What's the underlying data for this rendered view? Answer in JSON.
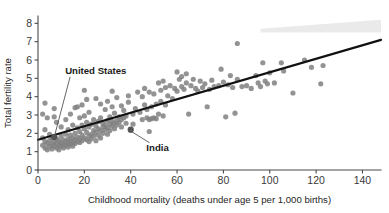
{
  "chart_data": {
    "type": "scatter",
    "title": "",
    "xlabel": "Childhood mortality (deaths under age 5 per 1,000 births)",
    "ylabel": "Total fertility rate",
    "xlim": [
      0,
      148
    ],
    "ylim": [
      0,
      8.4
    ],
    "xticks": [
      0,
      20,
      40,
      60,
      80,
      100,
      120,
      140
    ],
    "yticks": [
      0,
      1,
      2,
      3,
      4,
      5,
      6,
      7,
      8
    ],
    "xtick_labels": [
      "0",
      "20",
      "40",
      "60",
      "80",
      "100",
      "120",
      "140"
    ],
    "ytick_labels": [
      "0",
      "1",
      "2",
      "3",
      "4",
      "5",
      "6",
      "7",
      "8"
    ],
    "grid": false,
    "legend": null,
    "marker_color": "#808080",
    "trendline_color": "#111111",
    "trendline": {
      "x": [
        0,
        148
      ],
      "y": [
        1.65,
        7.1
      ],
      "slope": 0.0368,
      "intercept": 1.65
    },
    "confidence_band": {
      "visible": true,
      "color": "#d9d9d9",
      "x": [
        96,
        148
      ],
      "y_upper": [
        7.7,
        8.2
      ],
      "y_lower": [
        7.5,
        7.5
      ]
    },
    "annotations": [
      {
        "label": "United States",
        "point_x": 7,
        "point_y": 1.8,
        "label_x": 13,
        "label_y": 5.25,
        "highlight": true
      },
      {
        "label": "India",
        "point_x": 40,
        "point_y": 2.2,
        "label_x": 49,
        "label_y": 1.05,
        "highlight": true
      }
    ],
    "points": [
      [
        2,
        3.05
      ],
      [
        3,
        3.65
      ],
      [
        4,
        2.85
      ],
      [
        3,
        2.2
      ],
      [
        2,
        1.75
      ],
      [
        3,
        1.55
      ],
      [
        2,
        1.35
      ],
      [
        3,
        1.2
      ],
      [
        4,
        1.45
      ],
      [
        4,
        1.1
      ],
      [
        5,
        1.3
      ],
      [
        5,
        1.6
      ],
      [
        5,
        1.95
      ],
      [
        6,
        1.4
      ],
      [
        6,
        1.15
      ],
      [
        6,
        1.75
      ],
      [
        7,
        1.55
      ],
      [
        7,
        1.3
      ],
      [
        7,
        2.9
      ],
      [
        7,
        3.35
      ],
      [
        8,
        1.45
      ],
      [
        8,
        1.2
      ],
      [
        8,
        1.7
      ],
      [
        8,
        2.6
      ],
      [
        9,
        1.35
      ],
      [
        9,
        1.6
      ],
      [
        9,
        1.1
      ],
      [
        10,
        1.5
      ],
      [
        10,
        1.3
      ],
      [
        10,
        1.85
      ],
      [
        10,
        2.35
      ],
      [
        11,
        1.4
      ],
      [
        11,
        1.65
      ],
      [
        11,
        1.2
      ],
      [
        12,
        1.55
      ],
      [
        12,
        1.35
      ],
      [
        12,
        1.95
      ],
      [
        12,
        2.75
      ],
      [
        13,
        1.45
      ],
      [
        13,
        1.7
      ],
      [
        13,
        1.25
      ],
      [
        13,
        2.2
      ],
      [
        14,
        1.6
      ],
      [
        14,
        1.4
      ],
      [
        14,
        1.9
      ],
      [
        14,
        3.05
      ],
      [
        15,
        1.5
      ],
      [
        15,
        1.75
      ],
      [
        15,
        1.3
      ],
      [
        15,
        2.45
      ],
      [
        16,
        1.65
      ],
      [
        16,
        1.45
      ],
      [
        16,
        2.0
      ],
      [
        16,
        3.4
      ],
      [
        17,
        1.55
      ],
      [
        17,
        1.8
      ],
      [
        17,
        2.3
      ],
      [
        17,
        3.45
      ],
      [
        18,
        1.7
      ],
      [
        18,
        1.5
      ],
      [
        18,
        2.1
      ],
      [
        18,
        2.85
      ],
      [
        19,
        1.6
      ],
      [
        19,
        1.9
      ],
      [
        19,
        2.45
      ],
      [
        19,
        3.55
      ],
      [
        20,
        1.75
      ],
      [
        20,
        2.25
      ],
      [
        20,
        2.95
      ],
      [
        20,
        4.35
      ],
      [
        21,
        1.65
      ],
      [
        21,
        2.05
      ],
      [
        21,
        2.6
      ],
      [
        21,
        3.85
      ],
      [
        22,
        1.85
      ],
      [
        22,
        2.35
      ],
      [
        22,
        1.55
      ],
      [
        22,
        3.15
      ],
      [
        23,
        1.95
      ],
      [
        23,
        2.5
      ],
      [
        23,
        1.7
      ],
      [
        24,
        2.15
      ],
      [
        24,
        2.75
      ],
      [
        24,
        1.85
      ],
      [
        25,
        2.05
      ],
      [
        25,
        2.4
      ],
      [
        25,
        1.6
      ],
      [
        25,
        3.9
      ],
      [
        26,
        2.25
      ],
      [
        26,
        2.65
      ],
      [
        26,
        1.9
      ],
      [
        27,
        2.15
      ],
      [
        27,
        2.85
      ],
      [
        27,
        1.75
      ],
      [
        27,
        3.6
      ],
      [
        28,
        2.35
      ],
      [
        28,
        2.55
      ],
      [
        28,
        2.0
      ],
      [
        29,
        2.45
      ],
      [
        29,
        2.2
      ],
      [
        29,
        3.3
      ],
      [
        30,
        2.3
      ],
      [
        30,
        2.7
      ],
      [
        30,
        1.95
      ],
      [
        30,
        3.75
      ],
      [
        31,
        2.5
      ],
      [
        31,
        2.9
      ],
      [
        31,
        2.15
      ],
      [
        32,
        2.4
      ],
      [
        32,
        2.65
      ],
      [
        32,
        3.45
      ],
      [
        32,
        4.3
      ],
      [
        33,
        2.55
      ],
      [
        33,
        2.25
      ],
      [
        33,
        3.1
      ],
      [
        34,
        2.7
      ],
      [
        34,
        2.45
      ],
      [
        34,
        3.95
      ],
      [
        35,
        2.6
      ],
      [
        35,
        2.9
      ],
      [
        36,
        2.75
      ],
      [
        36,
        3.5
      ],
      [
        36,
        2.35
      ],
      [
        37,
        2.85
      ],
      [
        37,
        3.25
      ],
      [
        38,
        2.95
      ],
      [
        38,
        2.55
      ],
      [
        39,
        4.05
      ],
      [
        39,
        3.7
      ],
      [
        40,
        2.2
      ],
      [
        41,
        3.05
      ],
      [
        41,
        2.5
      ],
      [
        42,
        3.35
      ],
      [
        43,
        4.25
      ],
      [
        44,
        3.15
      ],
      [
        45,
        2.75
      ],
      [
        45,
        4.0
      ],
      [
        46,
        3.55
      ],
      [
        46,
        4.45
      ],
      [
        47,
        2.85
      ],
      [
        47,
        3.3
      ],
      [
        48,
        2.75
      ],
      [
        48,
        4.25
      ],
      [
        48,
        2.1
      ],
      [
        49,
        2.8
      ],
      [
        49,
        3.45
      ],
      [
        50,
        2.85
      ],
      [
        50,
        4.15
      ],
      [
        51,
        3.6
      ],
      [
        51,
        2.8
      ],
      [
        52,
        3.05
      ],
      [
        52,
        4.75
      ],
      [
        53,
        3.75
      ],
      [
        53,
        4.35
      ],
      [
        54,
        2.95
      ],
      [
        54,
        4.85
      ],
      [
        55,
        3.55
      ],
      [
        55,
        4.5
      ],
      [
        56,
        4.05
      ],
      [
        57,
        4.6
      ],
      [
        58,
        3.9
      ],
      [
        59,
        4.45
      ],
      [
        60,
        5.35
      ],
      [
        60,
        4.3
      ],
      [
        61,
        4.95
      ],
      [
        62,
        5.1
      ],
      [
        62,
        4.55
      ],
      [
        63,
        4.4
      ],
      [
        64,
        5.25
      ],
      [
        64,
        4.75
      ],
      [
        65,
        3.05
      ],
      [
        66,
        4.6
      ],
      [
        67,
        4.95
      ],
      [
        68,
        4.45
      ],
      [
        69,
        4.3
      ],
      [
        70,
        4.85
      ],
      [
        71,
        4.5
      ],
      [
        72,
        4.7
      ],
      [
        73,
        3.45
      ],
      [
        74,
        4.4
      ],
      [
        75,
        4.9
      ],
      [
        76,
        4.55
      ],
      [
        78,
        4.6
      ],
      [
        79,
        5.5
      ],
      [
        80,
        4.8
      ],
      [
        81,
        2.9
      ],
      [
        82,
        4.65
      ],
      [
        83,
        5.15
      ],
      [
        84,
        4.5
      ],
      [
        85,
        3.1
      ],
      [
        86,
        6.9
      ],
      [
        86,
        4.95
      ],
      [
        88,
        4.55
      ],
      [
        90,
        4.6
      ],
      [
        92,
        4.45
      ],
      [
        94,
        5.15
      ],
      [
        95,
        4.75
      ],
      [
        96,
        4.55
      ],
      [
        97,
        5.85
      ],
      [
        98,
        4.85
      ],
      [
        99,
        4.7
      ],
      [
        100,
        5.3
      ],
      [
        102,
        4.75
      ],
      [
        105,
        5.85
      ],
      [
        106,
        5.4
      ],
      [
        110,
        4.2
      ],
      [
        115,
        6.0
      ],
      [
        118,
        5.6
      ],
      [
        122,
        4.7
      ],
      [
        123,
        5.7
      ]
    ]
  }
}
